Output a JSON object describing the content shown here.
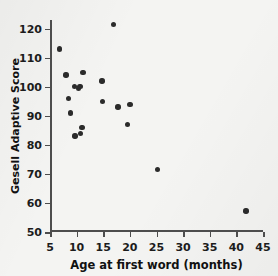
{
  "chart_data": {
    "type": "scatter",
    "title": "",
    "xlabel": "Age at first word (months)",
    "ylabel": "Gesell Adaptive Score",
    "xlim": [
      5,
      45
    ],
    "ylim": [
      50,
      123
    ],
    "xticks": [
      5,
      10,
      15,
      20,
      25,
      30,
      35,
      40,
      45
    ],
    "yticks": [
      50,
      60,
      70,
      80,
      90,
      100,
      110,
      120
    ],
    "xtick_labels": [
      "5",
      "10",
      "15",
      "20",
      "25",
      "30",
      "35",
      "40",
      "45"
    ],
    "ytick_labels": [
      "50",
      "60",
      "70",
      "80",
      "90",
      "100",
      "110",
      "120"
    ],
    "grid": false,
    "legend": null,
    "marker_color": "#2b2b2b",
    "axis_color": "#4d4d4d",
    "background_color": "#f4f4f2",
    "points": [
      {
        "x": 6.8,
        "y": 113
      },
      {
        "x": 8.0,
        "y": 104
      },
      {
        "x": 8.5,
        "y": 96
      },
      {
        "x": 8.8,
        "y": 91
      },
      {
        "x": 9.6,
        "y": 100
      },
      {
        "x": 9.7,
        "y": 83
      },
      {
        "x": 10.3,
        "y": 99.5
      },
      {
        "x": 10.6,
        "y": 100
      },
      {
        "x": 10.7,
        "y": 84
      },
      {
        "x": 11.0,
        "y": 86
      },
      {
        "x": 11.2,
        "y": 105
      },
      {
        "x": 14.8,
        "y": 102
      },
      {
        "x": 14.9,
        "y": 95
      },
      {
        "x": 16.9,
        "y": 121.5
      },
      {
        "x": 17.8,
        "y": 93
      },
      {
        "x": 19.6,
        "y": 87
      },
      {
        "x": 20.0,
        "y": 94
      },
      {
        "x": 25.2,
        "y": 71.5
      },
      {
        "x": 41.8,
        "y": 57.3
      }
    ]
  }
}
